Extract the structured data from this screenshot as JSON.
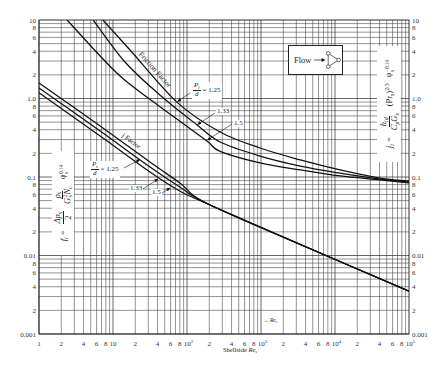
{
  "chart_data": {
    "type": "line",
    "title": "",
    "xlabel": "Shellside Re_s",
    "ylabel_left": "f_i = (Δp_s / 2)(ρ_s / (G_s² N_c)) φ_s^0.14",
    "ylabel_right": "j_i = (h_id / (C_p G_s)) (Pr_s)^(2/3) φ_s^-0.14",
    "xscale": "log",
    "yscale": "log",
    "xlim": [
      1,
      100000
    ],
    "ylim": [
      0.001,
      10
    ],
    "grid": true,
    "legend": "none (curves labeled inline)",
    "x_ticks": [
      {
        "v": 1,
        "label": "1"
      },
      {
        "v": 2,
        "label": "2"
      },
      {
        "v": 4,
        "label": "4"
      },
      {
        "v": 6,
        "label": "6"
      },
      {
        "v": 8,
        "label": "8"
      },
      {
        "v": 10,
        "label": "10"
      },
      {
        "v": 20,
        "label": "2"
      },
      {
        "v": 40,
        "label": "4"
      },
      {
        "v": 60,
        "label": "6"
      },
      {
        "v": 80,
        "label": "8"
      },
      {
        "v": 100,
        "label": "10",
        "sup": "2"
      },
      {
        "v": 200,
        "label": "2"
      },
      {
        "v": 400,
        "label": "4"
      },
      {
        "v": 600,
        "label": "6"
      },
      {
        "v": 800,
        "label": "8"
      },
      {
        "v": 1000,
        "label": "10",
        "sup": "3"
      },
      {
        "v": 2000,
        "label": "2"
      },
      {
        "v": 4000,
        "label": "4"
      },
      {
        "v": 6000,
        "label": "6"
      },
      {
        "v": 8000,
        "label": "8"
      },
      {
        "v": 10000,
        "label": "10",
        "sup": "4"
      },
      {
        "v": 20000,
        "label": "2"
      },
      {
        "v": 40000,
        "label": "4"
      },
      {
        "v": 60000,
        "label": "6"
      },
      {
        "v": 80000,
        "label": "8"
      },
      {
        "v": 100000,
        "label": "10",
        "sup": "5"
      }
    ],
    "y_ticks": [
      {
        "v": 10,
        "label": "10"
      },
      {
        "v": 8,
        "label": "8"
      },
      {
        "v": 6,
        "label": "6"
      },
      {
        "v": 4,
        "label": "4"
      },
      {
        "v": 2,
        "label": "2"
      },
      {
        "v": 1,
        "label": "1.0"
      },
      {
        "v": 0.8,
        "label": "8"
      },
      {
        "v": 0.6,
        "label": "6"
      },
      {
        "v": 0.4,
        "label": "4"
      },
      {
        "v": 0.2,
        "label": "2"
      },
      {
        "v": 0.1,
        "label": "0.1"
      },
      {
        "v": 0.08,
        "label": "8"
      },
      {
        "v": 0.06,
        "label": "6"
      },
      {
        "v": 0.04,
        "label": "4"
      },
      {
        "v": 0.02,
        "label": "2"
      },
      {
        "v": 0.01,
        "label": "0.01"
      },
      {
        "v": 0.008,
        "label": "8"
      },
      {
        "v": 0.006,
        "label": "6"
      },
      {
        "v": 0.004,
        "label": "4"
      },
      {
        "v": 0.002,
        "label": "2"
      },
      {
        "v": 0.001,
        "label": "0.001"
      }
    ],
    "y2_ticks": [
      {
        "v": 10,
        "label": "10"
      },
      {
        "v": 8,
        "label": "8"
      },
      {
        "v": 6,
        "label": "6"
      },
      {
        "v": 4,
        "label": "4"
      },
      {
        "v": 2,
        "label": "2"
      },
      {
        "v": 1,
        "label": "1.0"
      },
      {
        "v": 0.8,
        "label": "8"
      },
      {
        "v": 0.6,
        "label": "6"
      },
      {
        "v": 0.4,
        "label": "4"
      },
      {
        "v": 0.2,
        "label": "2"
      },
      {
        "v": 0.1,
        "label": "0.1"
      },
      {
        "v": 0.08,
        "label": "8"
      },
      {
        "v": 0.06,
        "label": "6"
      },
      {
        "v": 0.04,
        "label": "4"
      },
      {
        "v": 0.02,
        "label": "2"
      },
      {
        "v": 0.01,
        "label": "0.01"
      },
      {
        "v": 0.008,
        "label": "8"
      },
      {
        "v": 0.006,
        "label": "6"
      },
      {
        "v": 0.004,
        "label": "4"
      },
      {
        "v": 0.002,
        "label": "2"
      },
      {
        "v": 0.001,
        "label": "0.001"
      }
    ],
    "series": [
      {
        "name": "Friction Factor, Pt/d = 1.25",
        "group": "friction-factor",
        "pitch_ratio": 1.25,
        "points": [
          [
            7.3,
            10
          ],
          [
            17,
            4.15
          ],
          [
            73,
            0.9
          ],
          [
            280,
            0.374
          ],
          [
            970,
            0.234
          ],
          [
            3400,
            0.165
          ],
          [
            11700,
            0.123
          ],
          [
            40600,
            0.097
          ],
          [
            100000,
            0.089
          ]
        ]
      },
      {
        "name": "Friction Factor, Pt/d = 1.33",
        "group": "friction-factor",
        "pitch_ratio": 1.33,
        "points": [
          [
            5.4,
            10
          ],
          [
            14.5,
            2.92
          ],
          [
            43,
            1.11
          ],
          [
            137,
            0.46
          ],
          [
            280,
            0.279
          ],
          [
            970,
            0.185
          ],
          [
            3400,
            0.138
          ],
          [
            11700,
            0.112
          ],
          [
            40600,
            0.094
          ],
          [
            100000,
            0.086
          ]
        ]
      },
      {
        "name": "Friction Factor, Pt/d = 1.5",
        "group": "friction-factor",
        "pitch_ratio": 1.5,
        "points": [
          [
            2.4,
            10
          ],
          [
            6.7,
            3.48
          ],
          [
            15.5,
            1.62
          ],
          [
            73,
            0.548
          ],
          [
            186,
            0.287
          ],
          [
            280,
            0.212
          ],
          [
            970,
            0.151
          ],
          [
            3400,
            0.123
          ],
          [
            11700,
            0.103
          ],
          [
            40600,
            0.092
          ],
          [
            100000,
            0.084
          ]
        ]
      },
      {
        "name": "j Factor, Pt/d = 1.25",
        "group": "j-factor",
        "pitch_ratio": 1.25,
        "points": [
          [
            1,
            1.58
          ],
          [
            6.7,
            0.446
          ],
          [
            31.6,
            0.155
          ],
          [
            80,
            0.084
          ],
          [
            205,
            0.044
          ],
          [
            8560,
            0.0095
          ],
          [
            100000,
            0.0035
          ]
        ]
      },
      {
        "name": "j Factor, Pt/d = 1.33",
        "group": "j-factor",
        "pitch_ratio": 1.33,
        "points": [
          [
            1,
            1.36
          ],
          [
            6.7,
            0.385
          ],
          [
            31.6,
            0.134
          ],
          [
            80,
            0.0746
          ],
          [
            205,
            0.044
          ],
          [
            8560,
            0.0095
          ],
          [
            100000,
            0.0035
          ]
        ]
      },
      {
        "name": "j Factor, Pt/d = 1.5",
        "group": "j-factor",
        "pitch_ratio": 1.5,
        "points": [
          [
            1,
            1.18
          ],
          [
            6.7,
            0.333
          ],
          [
            31.6,
            0.116
          ],
          [
            80,
            0.0663
          ],
          [
            205,
            0.044
          ],
          [
            8560,
            0.0095
          ],
          [
            100000,
            0.0035
          ]
        ]
      }
    ],
    "annotations": [
      "Friction Factor",
      "j Factor",
      "Pt/d = 1.25",
      "1.33",
      "1.5",
      "Flow (triangular layout inset)",
      "→ Re_s"
    ]
  },
  "axis_title": {
    "prefix": "Shellside ",
    "var": "Re",
    "sub": "s"
  },
  "re_arrow_label": {
    "arrow": "→",
    "var": "Re",
    "sub": "s"
  },
  "left_axis_formula": {
    "f": "f",
    "f_sub": "i",
    "eq": "=",
    "dp": "Δp",
    "dp_sub": "s",
    "dp_den": "2",
    "rho": "ρ",
    "rho_sub": "s",
    "G": "G",
    "G_sup": "2",
    "G_sub": "s",
    "N": "N",
    "N_sub": "c",
    "phi": "φ",
    "phi_sub": "s",
    "phi_sup": "0.14"
  },
  "right_axis_formula": {
    "j": "j",
    "j_sub": "i",
    "eq": "=",
    "h": "h",
    "h_sub": "id",
    "C": "C",
    "C_sub": "p",
    "G": "G",
    "G_sub": "s",
    "pr_open": "(Pr",
    "pr_sub": "s",
    "pr_close": ")",
    "pr_sup": "2/3",
    "phi": "φ",
    "phi_sub": "s",
    "phi_sup": "−0.14"
  },
  "curve_labels": {
    "friction": "Friction Factor",
    "j": "j Factor",
    "friction_pitch": {
      "num": "P",
      "num_sub": "t",
      "den": "d",
      "eq_value": "= 1.25",
      "value_2": "1.33",
      "value_3": "1.5"
    },
    "j_pitch": {
      "num": "P",
      "num_sub": "t",
      "den": "d",
      "eq_value": "= 1.25",
      "value_2": "1.33",
      "value_3": "1.5"
    }
  },
  "flow_inset": {
    "label": "Flow",
    "icon": "triangular-tube-layout-icon"
  }
}
